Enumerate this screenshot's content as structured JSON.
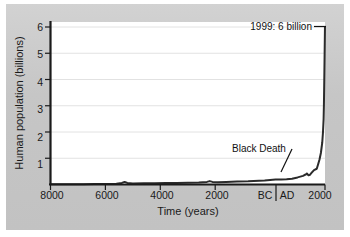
{
  "figure": {
    "background_color": "#c9c9c9",
    "plot_background_color": "#ffffff",
    "axis_color": "#1a1a1a",
    "grid_color": "#e2e2e2",
    "line_color": "#2b2b2b"
  },
  "chart_data": {
    "type": "line",
    "title": "",
    "xlabel": "Time (years)",
    "ylabel": "Human population (billions)",
    "xlim": [
      -8000,
      2000
    ],
    "ylim": [
      0,
      6.3
    ],
    "grid": true,
    "legend": "none",
    "x_tick_labels": [
      "8000",
      "6000",
      "4000",
      "2000",
      "BC",
      "AD",
      "2000"
    ],
    "x_tick_values": [
      -8000,
      -6000,
      -4000,
      -2000,
      -50,
      50,
      2000
    ],
    "y_tick_labels": [
      "1",
      "2",
      "3",
      "4",
      "5",
      "6"
    ],
    "y_tick_values": [
      1,
      2,
      3,
      4,
      5,
      6
    ],
    "series": [
      {
        "name": "Human population",
        "x": [
          -8000,
          -7600,
          -7200,
          -6800,
          -6400,
          -6000,
          -5600,
          -5400,
          -5300,
          -5200,
          -5000,
          -4600,
          -4200,
          -3800,
          -3400,
          -3000,
          -2600,
          -2300,
          -2200,
          -2100,
          -1900,
          -1600,
          -1200,
          -800,
          -400,
          -200,
          0,
          200,
          400,
          600,
          800,
          1000,
          1100,
          1200,
          1250,
          1300,
          1340,
          1400,
          1450,
          1500,
          1600,
          1700,
          1750,
          1800,
          1850,
          1900,
          1927,
          1950,
          1960,
          1974,
          1987,
          1999
        ],
        "y": [
          0.005,
          0.007,
          0.009,
          0.012,
          0.015,
          0.018,
          0.03,
          0.06,
          0.1,
          0.06,
          0.04,
          0.045,
          0.05,
          0.055,
          0.06,
          0.07,
          0.08,
          0.1,
          0.13,
          0.1,
          0.09,
          0.1,
          0.11,
          0.12,
          0.14,
          0.15,
          0.17,
          0.19,
          0.19,
          0.2,
          0.22,
          0.27,
          0.3,
          0.33,
          0.36,
          0.38,
          0.42,
          0.35,
          0.37,
          0.43,
          0.55,
          0.6,
          0.77,
          0.95,
          1.2,
          1.6,
          2.0,
          2.5,
          3.0,
          4.0,
          5.0,
          6.0
        ]
      }
    ],
    "annotations": [
      {
        "name": "population-1999",
        "text": "1999: 6 billion",
        "target_x": 1999,
        "target_y": 6.0
      },
      {
        "name": "black-death",
        "text": "Black Death",
        "target_x": 1400,
        "target_y": 0.35
      }
    ]
  }
}
